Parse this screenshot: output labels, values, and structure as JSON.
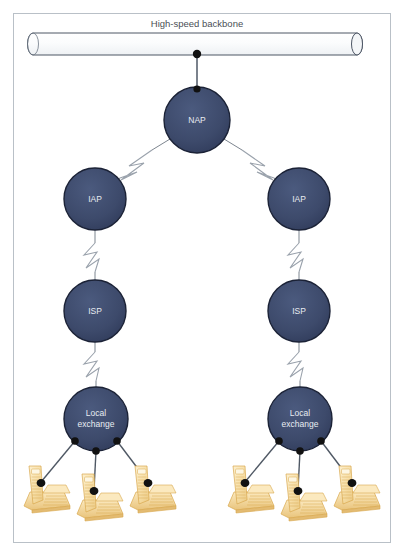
{
  "diagram": {
    "title": "High-speed backbone",
    "backbone": {
      "label": "High-speed backbone",
      "shape": "cylinder"
    },
    "nodes": [
      {
        "id": "nap",
        "label": "NAP",
        "cx": 197,
        "cy": 120,
        "r": 33
      },
      {
        "id": "iap_left",
        "label": "IAP",
        "cx": 95,
        "cy": 199,
        "r": 31
      },
      {
        "id": "iap_right",
        "label": "IAP",
        "cx": 299,
        "cy": 199,
        "r": 31
      },
      {
        "id": "isp_left",
        "label": "ISP",
        "cx": 95,
        "cy": 311,
        "r": 31
      },
      {
        "id": "isp_right",
        "label": "ISP",
        "cx": 299,
        "cy": 311,
        "r": 31
      },
      {
        "id": "lex_left",
        "label": "Local exchange",
        "line1": "Local",
        "line2": "exchange",
        "cx": 96,
        "cy": 419,
        "r": 32
      },
      {
        "id": "lex_right",
        "label": "Local exchange",
        "line1": "Local",
        "line2": "exchange",
        "cx": 300,
        "cy": 419,
        "r": 32
      }
    ],
    "phones": [
      {
        "id": "phone-left-1",
        "x": 24,
        "y": 466
      },
      {
        "id": "phone-left-2",
        "x": 77,
        "y": 474
      },
      {
        "id": "phone-left-3",
        "x": 130,
        "y": 466
      },
      {
        "id": "phone-right-1",
        "x": 228,
        "y": 466
      },
      {
        "id": "phone-right-2",
        "x": 281,
        "y": 474
      },
      {
        "id": "phone-right-3",
        "x": 334,
        "y": 466
      }
    ],
    "colors": {
      "node_fill": "#3d4a6b",
      "node_stroke": "#1b2236",
      "node_text": "#e8ecf2",
      "line": "#5a6370",
      "dot": "#111111",
      "frame_border": "#b9c0c7",
      "title_text": "#4a4f55",
      "backbone_stroke": "#4d5665",
      "phone_fill": "#f7dfa8",
      "phone_stroke": "#d9a84e",
      "background": "#ffffff"
    }
  }
}
